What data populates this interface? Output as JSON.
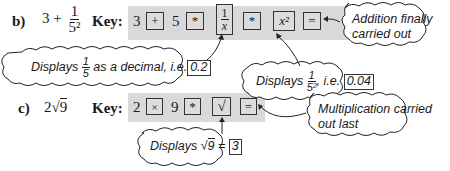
{
  "part_b": {
    "label": "b)",
    "expression": {
      "whole": "3 +",
      "numerator": "1",
      "denominator": "5²"
    },
    "key_label": "Key:",
    "sequence": [
      {
        "type": "digit",
        "text": "3"
      },
      {
        "type": "key",
        "text": "+",
        "name": "plus-key"
      },
      {
        "type": "digit",
        "text": "5"
      },
      {
        "type": "key",
        "text": "*",
        "name": "star-key"
      },
      {
        "type": "key",
        "text": "1/x",
        "name": "reciprocal-key",
        "numerator": "1",
        "denominator": "x"
      },
      {
        "type": "key",
        "text": "*",
        "name": "star-key"
      },
      {
        "type": "key",
        "text": "x²",
        "name": "square-key"
      },
      {
        "type": "key",
        "text": "=",
        "name": "equals-key"
      }
    ],
    "callouts": {
      "reciprocal": {
        "prefix": "Displays",
        "frac_num": "1",
        "frac_den": "5",
        "middle": "as a decimal, i.e.",
        "result": "0.2"
      },
      "square": {
        "prefix": "Displays",
        "frac_num": "1",
        "frac_den": "5²",
        "middle": ", i.e.",
        "result": "0.04"
      },
      "equals": {
        "line1": "Addition finally",
        "line2": "carried out"
      }
    }
  },
  "part_c": {
    "label": "c)",
    "expression": {
      "coef": "2",
      "radicand": "9"
    },
    "key_label": "Key:",
    "sequence": [
      {
        "type": "digit",
        "text": "2"
      },
      {
        "type": "key",
        "text": "×",
        "name": "multiply-key"
      },
      {
        "type": "digit",
        "text": "9"
      },
      {
        "type": "key",
        "text": "*",
        "name": "star-key"
      },
      {
        "type": "key",
        "text": "√",
        "name": "sqrt-key"
      },
      {
        "type": "key",
        "text": "=",
        "name": "equals-key"
      }
    ],
    "callouts": {
      "sqrt": {
        "prefix": "Displays",
        "radicand": "9",
        "equals": "=",
        "result": "3"
      },
      "equals": {
        "line1": "Multiplication carried",
        "line2": "out last"
      }
    }
  }
}
